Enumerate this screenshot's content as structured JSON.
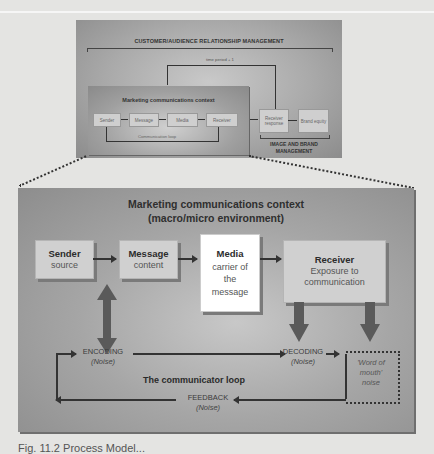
{
  "top_diagram": {
    "crm_title": "CUSTOMER/AUDIENCE RELATIONSHIP MANAGEMENT",
    "time_period_label": "time period + 1",
    "context_title": "Marketing communications context",
    "flow": [
      "Sender",
      "Message",
      "Media",
      "Receiver"
    ],
    "loop_label": "Communication loop",
    "response_box": "Receiver response",
    "equity_box": "Brand equity",
    "image_brand_label_line1": "IMAGE AND BRAND",
    "image_brand_label_line2": "MANAGEMENT"
  },
  "bottom_diagram": {
    "title_line1": "Marketing communications context",
    "title_line2": "(macro/micro environment)",
    "boxes": {
      "sender": {
        "title": "Sender",
        "sub": "source"
      },
      "message": {
        "title": "Message",
        "sub": "content"
      },
      "media": {
        "title": "Media",
        "sub_line1": "carrier of",
        "sub_line2": "the",
        "sub_line3": "message"
      },
      "receiver": {
        "title": "Receiver",
        "sub_line1": "Exposure to",
        "sub_line2": "communication"
      }
    },
    "encoding": {
      "label": "ENCODING",
      "note": "(Noise)"
    },
    "decoding": {
      "label": "DECODING",
      "note": "(Noise)"
    },
    "feedback": {
      "label": "FEEDBACK",
      "note": "(Noise)"
    },
    "word_of_mouth": {
      "line1": "'Word of",
      "line2": "mouth'",
      "line3": "noise"
    },
    "loop_title": "The communicator loop"
  },
  "caption": "Fig. 11.2 Process Model..."
}
